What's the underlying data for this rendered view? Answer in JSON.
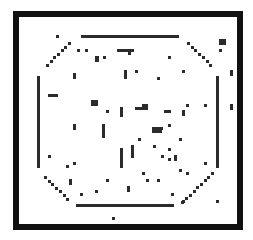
{
  "board": {
    "frame": {
      "x": 13,
      "y": 11,
      "w": 230,
      "h": 219,
      "border": 6,
      "color": "#111111"
    },
    "cell_color": "#2b2b2b",
    "walls": [
      {
        "name": "top-wall",
        "x": 81,
        "y": 35,
        "w": 98,
        "h": 3
      },
      {
        "name": "bottom-wall",
        "x": 76,
        "y": 204,
        "w": 98,
        "h": 3
      },
      {
        "name": "left-wall",
        "x": 37,
        "y": 76,
        "w": 3,
        "h": 92
      },
      {
        "name": "right-wall",
        "x": 216,
        "y": 76,
        "w": 3,
        "h": 92
      }
    ],
    "diagonals": [
      {
        "name": "diag-top-left",
        "x0": 68,
        "y0": 42,
        "dx": -3.7,
        "dy": 3.6,
        "count": 7
      },
      {
        "name": "diag-top-right",
        "x0": 187,
        "y0": 42,
        "dx": 3.7,
        "dy": 3.6,
        "count": 7
      },
      {
        "name": "diag-bottom-left",
        "x0": 44,
        "y0": 176,
        "dx": 3.7,
        "dy": 3.6,
        "count": 7
      },
      {
        "name": "diag-bottom-right",
        "x0": 211,
        "y0": 172,
        "dx": -3.7,
        "dy": 3.6,
        "count": 9
      }
    ],
    "cells": [
      [
        56,
        35,
        3,
        3
      ],
      [
        77,
        49,
        3,
        3
      ],
      [
        85,
        49,
        3,
        3
      ],
      [
        95,
        56,
        4,
        6
      ],
      [
        103,
        56,
        3,
        3
      ],
      [
        117,
        49,
        17,
        3
      ],
      [
        128,
        52,
        3,
        3
      ],
      [
        168,
        56,
        3,
        3
      ],
      [
        219,
        39,
        7,
        6
      ],
      [
        219,
        49,
        3,
        3
      ],
      [
        73,
        73,
        3,
        6
      ],
      [
        124,
        70,
        3,
        9
      ],
      [
        135,
        70,
        3,
        3
      ],
      [
        157,
        77,
        3,
        3
      ],
      [
        182,
        70,
        3,
        3
      ],
      [
        230,
        70,
        3,
        6
      ],
      [
        48,
        94,
        10,
        3
      ],
      [
        91,
        100,
        7,
        6
      ],
      [
        106,
        110,
        3,
        3
      ],
      [
        120,
        107,
        3,
        10
      ],
      [
        135,
        107,
        10,
        3
      ],
      [
        142,
        104,
        6,
        6
      ],
      [
        164,
        110,
        7,
        3
      ],
      [
        182,
        110,
        3,
        6
      ],
      [
        186,
        104,
        3,
        3
      ],
      [
        204,
        104,
        3,
        3
      ],
      [
        230,
        104,
        3,
        6
      ],
      [
        73,
        124,
        3,
        6
      ],
      [
        102,
        124,
        3,
        14
      ],
      [
        168,
        124,
        3,
        3
      ],
      [
        152,
        127,
        10,
        6
      ],
      [
        157,
        127,
        6,
        3
      ],
      [
        138,
        138,
        3,
        3
      ],
      [
        179,
        138,
        3,
        3
      ],
      [
        153,
        145,
        3,
        3
      ],
      [
        120,
        148,
        3,
        20
      ],
      [
        131,
        145,
        3,
        13
      ],
      [
        168,
        148,
        3,
        3
      ],
      [
        161,
        155,
        3,
        3
      ],
      [
        168,
        158,
        3,
        3
      ],
      [
        174,
        155,
        3,
        6
      ],
      [
        48,
        155,
        3,
        3
      ],
      [
        73,
        162,
        3,
        3
      ],
      [
        66,
        165,
        3,
        3
      ],
      [
        204,
        162,
        3,
        3
      ],
      [
        179,
        169,
        3,
        3
      ],
      [
        186,
        172,
        3,
        3
      ],
      [
        142,
        172,
        3,
        3
      ],
      [
        69,
        179,
        3,
        6
      ],
      [
        106,
        179,
        3,
        3
      ],
      [
        146,
        179,
        3,
        3
      ],
      [
        157,
        179,
        3,
        3
      ],
      [
        127,
        186,
        3,
        6
      ],
      [
        95,
        190,
        3,
        3
      ],
      [
        80,
        193,
        3,
        3
      ],
      [
        171,
        193,
        3,
        3
      ],
      [
        182,
        200,
        3,
        3
      ],
      [
        216,
        200,
        3,
        3
      ],
      [
        112,
        217,
        3,
        3
      ]
    ]
  }
}
